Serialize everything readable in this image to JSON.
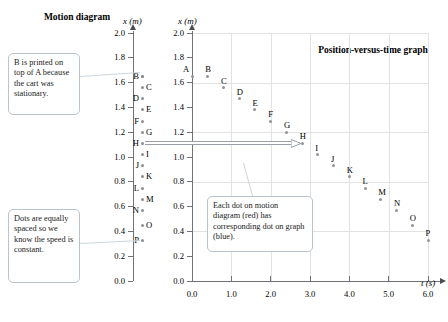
{
  "figure": {
    "motion_diagram_title": "Motion diagram",
    "graph_title": "Position-versus-time graph",
    "motion_axis_label": "x (m)",
    "graph_y_axis_label": "x (m)",
    "graph_x_axis_label": "t (s)"
  },
  "callouts": {
    "b_on_a": "B is printed on top of A because the cart was stationary.",
    "equal_spacing": "Dots are equally spaced so we know the speed is constant.",
    "correspondence": "Each dot on motion diagram (red) has corresponding dot on graph (blue)."
  },
  "axes": {
    "motion_y_ticks": [
      "2.0",
      "1.8",
      "1.6",
      "1.4",
      "1.2",
      "1.0",
      "0.8",
      "0.6",
      "0.4",
      "0.2",
      "0.0"
    ],
    "graph_y_ticks": [
      "2.0",
      "1.8",
      "1.6",
      "1.4",
      "1.2",
      "1.0",
      "0.8",
      "0.6",
      "0.4",
      "0.2",
      "0.0"
    ],
    "graph_x_ticks": [
      "0.0",
      "1.0",
      "2.0",
      "3.0",
      "4.0",
      "5.0",
      "6.0"
    ]
  },
  "chart_data": {
    "type": "scatter",
    "title": "Position-versus-time graph",
    "xlabel": "t (s)",
    "ylabel": "x (m)",
    "xlim": [
      0.0,
      6.0
    ],
    "ylim": [
      0.0,
      2.0
    ],
    "grid": true,
    "legend": "none",
    "point_labels": [
      "A",
      "B",
      "C",
      "D",
      "E",
      "F",
      "G",
      "H",
      "I",
      "J",
      "K",
      "L",
      "M",
      "N",
      "O",
      "P"
    ],
    "x": [
      0.0,
      0.4,
      0.8,
      1.2,
      1.6,
      2.0,
      2.4,
      2.8,
      3.2,
      3.6,
      4.0,
      4.4,
      4.8,
      5.2,
      5.6,
      6.0
    ],
    "y": [
      1.65,
      1.65,
      1.56,
      1.47,
      1.38,
      1.29,
      1.2,
      1.11,
      1.02,
      0.93,
      0.84,
      0.75,
      0.66,
      0.57,
      0.45,
      0.33
    ],
    "motion_diagram_positions": [
      1.65,
      1.65,
      1.56,
      1.47,
      1.38,
      1.29,
      1.2,
      1.11,
      1.02,
      0.93,
      0.84,
      0.75,
      0.66,
      0.57,
      0.45,
      0.33
    ],
    "motion_label_side": [
      "left",
      "left",
      "right",
      "left",
      "right",
      "left",
      "right",
      "left",
      "right",
      "left",
      "right",
      "left",
      "right",
      "left",
      "right",
      "left"
    ]
  },
  "annotation": {
    "correspondence_arrow_label": "H"
  }
}
